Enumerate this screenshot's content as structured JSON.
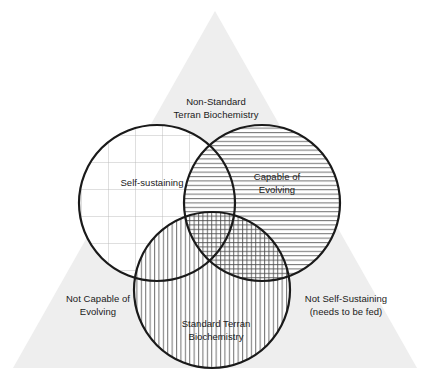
{
  "diagram": {
    "type": "venn-3-circle-with-triangle-background",
    "background_color": "#ffffff",
    "triangle": {
      "name": "backdrop-triangle",
      "fill": "#eeeeee",
      "apex": [
        215,
        11
      ],
      "base_left": [
        13,
        368
      ],
      "base_right": [
        417,
        368
      ]
    },
    "stroke_color": "#1a1a1a",
    "stroke_width": 2.2,
    "pattern_color": "#4a4a4a",
    "grid_color": "#b8b8b8",
    "circles": [
      {
        "id": "self-sustaining",
        "label": "Self-sustaining",
        "pattern": "grid",
        "cx": 157,
        "cy": 203,
        "r": 78
      },
      {
        "id": "capable-of-evolving",
        "label": "Capable of\nEvolving",
        "pattern": "horizontal-lines",
        "cx": 262,
        "cy": 203,
        "r": 78
      },
      {
        "id": "standard-terran-biochemistry",
        "label": "Standard Terran\nBiochemistry",
        "pattern": "vertical-lines",
        "cx": 212,
        "cy": 290,
        "r": 78
      }
    ],
    "labels": {
      "top": "Non-Standard\nTerran Biochemistry",
      "left": "Self-sustaining",
      "right": "Capable of\nEvolving",
      "bottom": "Standard Terran\nBiochemistry",
      "bottom_left": "Not Capable of\nEvolving",
      "bottom_right": "Not Self-Sustaining\n(needs to be fed)"
    }
  }
}
